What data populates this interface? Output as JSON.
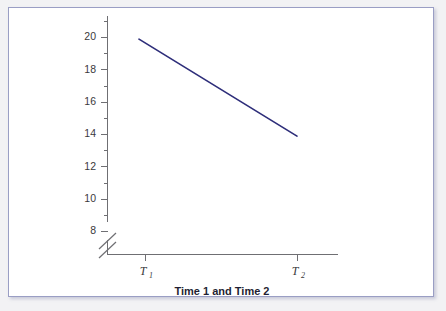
{
  "figure": {
    "background_color": "#f2f2f4",
    "panel_color": "#ffffff",
    "border_color": "#9a9ec4"
  },
  "axis": {
    "y_tick_labels": [
      "20",
      "18",
      "16",
      "14",
      "12",
      "10",
      "8"
    ],
    "x_tick_labels": [
      "T",
      "T"
    ],
    "x_tick_subscripts": [
      "1",
      "2"
    ],
    "x_axis_title": "Time 1 and Time 2",
    "break_symbol": "axis-break-double-slash"
  },
  "chart_data": {
    "type": "line",
    "title": "",
    "subtitle": "",
    "xlabel": "Time 1 and Time 2",
    "ylabel": "",
    "x": [
      "T₁",
      "T₂"
    ],
    "categories": [
      "T₁",
      "T₂"
    ],
    "series": [
      {
        "name": "mean score",
        "values": [
          19.9,
          13.9
        ],
        "color": "#2e2e7a",
        "line_width": 1.7,
        "markers": false
      }
    ],
    "values": [
      19.9,
      13.9
    ],
    "ylim": [
      8,
      21
    ],
    "yticks": [
      8,
      10,
      12,
      14,
      16,
      18,
      20
    ],
    "yticks_minor": [
      9,
      11,
      13,
      15,
      17,
      19,
      21
    ],
    "ytick_labels": [
      "8",
      "10",
      "12",
      "14",
      "16",
      "18",
      "20"
    ],
    "xlim": [
      "T₁",
      "T₂"
    ],
    "xticks": [
      "T₁",
      "T₂"
    ],
    "grid": false,
    "legend": false,
    "legend_position": "none",
    "y_axis_break": true,
    "y_axis_break_below": 8,
    "annotations": []
  }
}
